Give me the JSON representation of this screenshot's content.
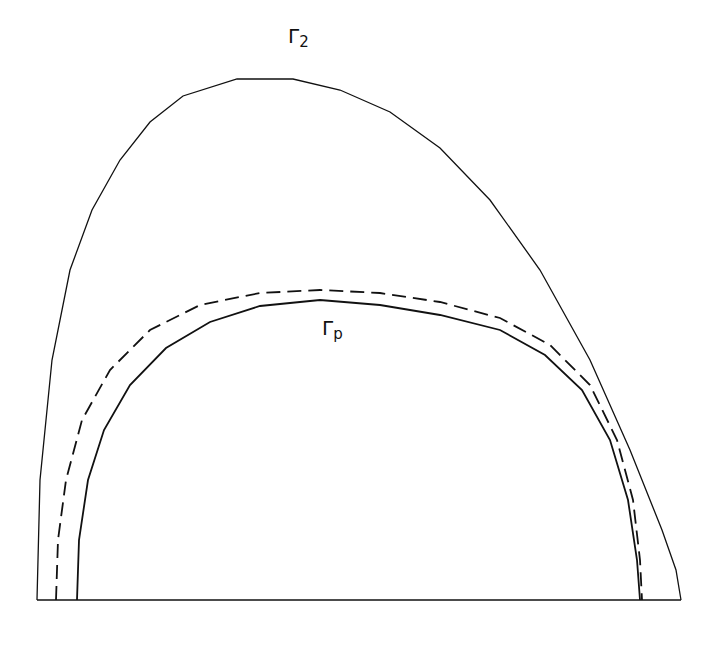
{
  "diagram": {
    "stroke_color": "#111111",
    "background": "#ffffff",
    "baseline": {
      "x1": 37,
      "x2": 681,
      "y": 600
    },
    "curves": [
      {
        "name": "gamma-2",
        "style": "solid",
        "label": "Γ",
        "subscript": "2",
        "points": [
          [
            37,
            600
          ],
          [
            40,
            480
          ],
          [
            52,
            360
          ],
          [
            70,
            270
          ],
          [
            92,
            210
          ],
          [
            120,
            160
          ],
          [
            150,
            122
          ],
          [
            183,
            96
          ],
          [
            237,
            79
          ],
          [
            293,
            79
          ],
          [
            340,
            90
          ],
          [
            390,
            112
          ],
          [
            440,
            148
          ],
          [
            490,
            200
          ],
          [
            540,
            270
          ],
          [
            590,
            360
          ],
          [
            630,
            450
          ],
          [
            662,
            530
          ],
          [
            676,
            570
          ],
          [
            681,
            600
          ]
        ]
      },
      {
        "name": "dashed-curve",
        "style": "dashed",
        "points": [
          [
            56,
            600
          ],
          [
            58,
            540
          ],
          [
            66,
            480
          ],
          [
            82,
            420
          ],
          [
            110,
            370
          ],
          [
            150,
            330
          ],
          [
            200,
            305
          ],
          [
            260,
            293
          ],
          [
            320,
            290
          ],
          [
            380,
            293
          ],
          [
            440,
            302
          ],
          [
            500,
            318
          ],
          [
            550,
            345
          ],
          [
            590,
            385
          ],
          [
            617,
            440
          ],
          [
            633,
            500
          ],
          [
            640,
            560
          ],
          [
            642,
            600
          ]
        ]
      },
      {
        "name": "gamma-p",
        "style": "solid",
        "label": "Γ",
        "subscript": "p",
        "points": [
          [
            77,
            600
          ],
          [
            79,
            540
          ],
          [
            88,
            480
          ],
          [
            104,
            430
          ],
          [
            130,
            385
          ],
          [
            166,
            348
          ],
          [
            210,
            322
          ],
          [
            260,
            306
          ],
          [
            320,
            300
          ],
          [
            380,
            305
          ],
          [
            440,
            315
          ],
          [
            500,
            330
          ],
          [
            545,
            355
          ],
          [
            582,
            390
          ],
          [
            610,
            440
          ],
          [
            628,
            500
          ],
          [
            637,
            560
          ],
          [
            640,
            600
          ]
        ]
      }
    ]
  },
  "labels": {
    "gamma2": {
      "base": "Γ",
      "sub": "2"
    },
    "gammap": {
      "base": "Γ",
      "sub": "p"
    }
  }
}
